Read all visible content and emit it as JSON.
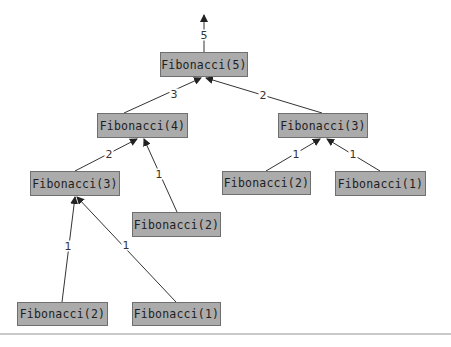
{
  "diagram": {
    "result_label": "5",
    "nodes": [
      {
        "id": "f5",
        "label": "Fibonacci(5)",
        "x": 160,
        "y": 52,
        "w": 88,
        "h": 25
      },
      {
        "id": "f4",
        "label": "Fibonacci(4)",
        "x": 97,
        "y": 113,
        "w": 91,
        "h": 25
      },
      {
        "id": "f3r",
        "label": "Fibonacci(3)",
        "x": 278,
        "y": 113,
        "w": 90,
        "h": 25
      },
      {
        "id": "f3l",
        "label": "Fibonacci(3)",
        "x": 30,
        "y": 171,
        "w": 90,
        "h": 25
      },
      {
        "id": "f2m",
        "label": "Fibonacci(2)",
        "x": 132,
        "y": 212,
        "w": 89,
        "h": 25
      },
      {
        "id": "f2r",
        "label": "Fibonacci(2)",
        "x": 222,
        "y": 171,
        "w": 89,
        "h": 24
      },
      {
        "id": "f1r",
        "label": "Fibonacci(1)",
        "x": 335,
        "y": 171,
        "w": 91,
        "h": 25
      },
      {
        "id": "f2b",
        "label": "Fibonacci(2)",
        "x": 17,
        "y": 302,
        "w": 91,
        "h": 24
      },
      {
        "id": "f1b",
        "label": "Fibonacci(1)",
        "x": 132,
        "y": 302,
        "w": 89,
        "h": 24
      }
    ],
    "edges": [
      {
        "from": "f4",
        "to": "f5",
        "label": "3",
        "x1": 124,
        "y1": 113,
        "x2": 201,
        "y2": 78,
        "lx": 174,
        "ly": 94
      },
      {
        "from": "f3r",
        "to": "f5",
        "label": "2",
        "x1": 322,
        "y1": 113,
        "x2": 206,
        "y2": 78,
        "lx": 263,
        "ly": 95
      },
      {
        "from": "f3l",
        "to": "f4",
        "label": "2",
        "x1": 75,
        "y1": 171,
        "x2": 137,
        "y2": 139,
        "lx": 109,
        "ly": 154
      },
      {
        "from": "f2m",
        "to": "f4",
        "label": "1",
        "x1": 177,
        "y1": 212,
        "x2": 144,
        "y2": 139,
        "lx": 159,
        "ly": 174
      },
      {
        "from": "f2r",
        "to": "f3r",
        "label": "1",
        "x1": 266,
        "y1": 171,
        "x2": 320,
        "y2": 139,
        "lx": 296,
        "ly": 154
      },
      {
        "from": "f1r",
        "to": "f3r",
        "label": "1",
        "x1": 380,
        "y1": 171,
        "x2": 327,
        "y2": 139,
        "lx": 353,
        "ly": 154
      },
      {
        "from": "f2b",
        "to": "f3l",
        "label": "1",
        "x1": 62,
        "y1": 302,
        "x2": 75,
        "y2": 197,
        "lx": 68,
        "ly": 246
      },
      {
        "from": "f1b",
        "to": "f3l",
        "label": "1",
        "x1": 176,
        "y1": 302,
        "x2": 77,
        "y2": 197,
        "lx": 126,
        "ly": 245
      }
    ],
    "result_edge": {
      "x1": 204,
      "y1": 52,
      "x2": 204,
      "y2": 15,
      "lx": 204,
      "ly": 35
    },
    "colors": {
      "node_fill": "#ababab",
      "node_border": "#6f6f6f",
      "edge": "#333333",
      "rule": "#c9c9c9"
    }
  }
}
